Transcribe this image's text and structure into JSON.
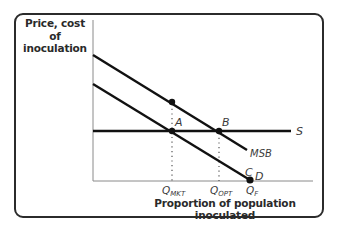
{
  "diagram": {
    "type": "economics-supply-demand",
    "y_axis_title": "Price, cost of inoculation",
    "y_axis_title_lines": [
      "Price, cost of",
      "inoculation"
    ],
    "x_axis_title": "Proportion of population inoculated",
    "curves": {
      "msb": {
        "label": "MSB",
        "from": [
          93,
          55
        ],
        "to": [
          247,
          150
        ]
      },
      "demand": {
        "label": "D",
        "from": [
          93,
          84
        ],
        "to": [
          250,
          180
        ]
      },
      "supply": {
        "label": "S",
        "from": [
          93,
          131
        ],
        "to": [
          291,
          131
        ]
      }
    },
    "points": {
      "msb_at_qmkt": {
        "label": "",
        "x": 172,
        "y": 102
      },
      "a": {
        "label": "A",
        "x": 172,
        "y": 131
      },
      "b": {
        "label": "B",
        "x": 219,
        "y": 131
      },
      "c": {
        "label": "C",
        "x": 250,
        "y": 180
      }
    },
    "x_ticks": {
      "q_mkt": {
        "base": "Q",
        "sub": "MKT"
      },
      "q_opt": {
        "base": "Q",
        "sub": "OPT"
      },
      "q_f": {
        "base": "Q",
        "sub": "F"
      }
    },
    "colors": {
      "curve": "#111111",
      "axis": "#8a8a8a",
      "frame": "#2b2b2b",
      "text": "#2a2a2a"
    }
  }
}
